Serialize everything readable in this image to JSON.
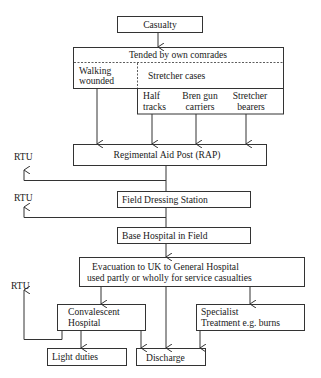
{
  "diagram": {
    "nodes": {
      "casualty": "Casualty",
      "tended": "Tended by own comrades",
      "walking_wounded": [
        "Walking",
        "wounded"
      ],
      "stretcher_cases": "Stretcher cases",
      "half_tracks": [
        "Half",
        "tracks"
      ],
      "bren_gun_carriers": [
        "Bren gun",
        "carriers"
      ],
      "stretcher_bearers": [
        "Stretcher",
        "bearers"
      ],
      "rap": "Regimental Aid Post (RAP)",
      "fds": "Field Dressing Station",
      "base_hospital": "Base Hospital in Field",
      "evacuation": [
        "Evacuation to UK to General Hospital",
        "used partly or wholly for service casualties"
      ],
      "convalescent": [
        "Convalescent",
        "Hospital"
      ],
      "specialist": [
        "Specialist",
        "Treatment e.g. burns"
      ],
      "light_duties": "Light duties",
      "discharge": "Discharge"
    },
    "rtu_labels": [
      "RTU",
      "RTU",
      "RTU"
    ],
    "edges": [
      [
        "casualty",
        "tended"
      ],
      [
        "walking_wounded",
        "rap"
      ],
      [
        "half_tracks",
        "rap"
      ],
      [
        "bren_gun_carriers",
        "rap"
      ],
      [
        "stretcher_bearers",
        "rap"
      ],
      [
        "rap",
        "rtu_1"
      ],
      [
        "rap",
        "fds"
      ],
      [
        "fds",
        "rtu_2"
      ],
      [
        "fds",
        "base_hospital"
      ],
      [
        "base_hospital",
        "evacuation"
      ],
      [
        "evacuation",
        "convalescent"
      ],
      [
        "evacuation",
        "discharge"
      ],
      [
        "evacuation",
        "specialist"
      ],
      [
        "convalescent",
        "rtu_3"
      ],
      [
        "convalescent",
        "light_duties"
      ],
      [
        "convalescent",
        "discharge"
      ],
      [
        "specialist",
        "discharge"
      ]
    ]
  }
}
